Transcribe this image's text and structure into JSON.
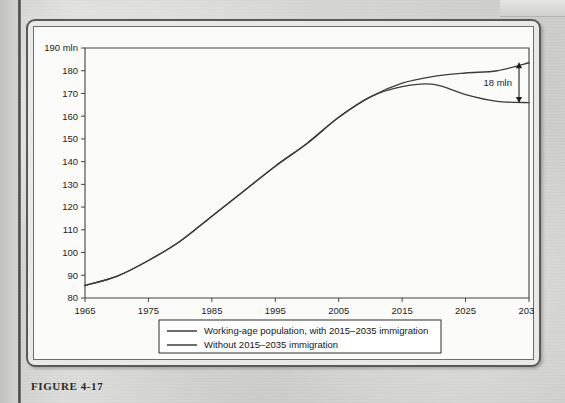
{
  "figure": {
    "caption": "FIGURE 4-17"
  },
  "chart_data": {
    "type": "line",
    "title": "",
    "xlabel": "",
    "ylabel": "",
    "y_unit_label": "190 mln",
    "xlim": [
      1965,
      2035
    ],
    "ylim": [
      80,
      190
    ],
    "grid": false,
    "legend_position": "bottom",
    "x_ticks": [
      "1965",
      "1975",
      "1985",
      "1995",
      "2005",
      "2015",
      "2025",
      "2035"
    ],
    "x_tick_values": [
      1965,
      1975,
      1985,
      1995,
      2005,
      2015,
      2025,
      2035
    ],
    "y_ticks": [
      "80",
      "90",
      "100",
      "110",
      "120",
      "130",
      "140",
      "150",
      "160",
      "170",
      "180",
      "190 mln"
    ],
    "y_tick_values": [
      80,
      90,
      100,
      110,
      120,
      130,
      140,
      150,
      160,
      170,
      180,
      190
    ],
    "x": [
      1965,
      1970,
      1975,
      1980,
      1985,
      1990,
      1995,
      2000,
      2005,
      2010,
      2015,
      2020,
      2025,
      2030,
      2035
    ],
    "series": [
      {
        "name": "Working-age population, with 2015–2035 immigration",
        "values": [
          85.5,
          89.5,
          96.5,
          105.0,
          116.0,
          127.0,
          138.0,
          148.0,
          159.5,
          168.5,
          174.5,
          177.5,
          179.0,
          180.0,
          183.5
        ]
      },
      {
        "name": "Without 2015–2035 immigration",
        "values": [
          85.5,
          89.5,
          96.5,
          105.0,
          116.0,
          127.0,
          138.0,
          148.0,
          159.5,
          168.5,
          173.0,
          174.0,
          169.5,
          166.5,
          166.0
        ]
      }
    ],
    "annotations": [
      {
        "text": "18 mln",
        "x": 2035,
        "y_top": 183.5,
        "y_bottom": 166.0,
        "kind": "double-arrow-gap"
      }
    ],
    "legend": [
      {
        "label": "Working-age population, with 2015–2035 immigration"
      },
      {
        "label": "Without 2015–2035 immigration"
      }
    ]
  },
  "colors": {
    "line": "#3c3c3a",
    "axis": "#444442",
    "panel_bg": "#fbfbfa",
    "frame_border": "#5a5a58",
    "page_bg": "#d8d8d6",
    "text": "#1d1d1b"
  }
}
